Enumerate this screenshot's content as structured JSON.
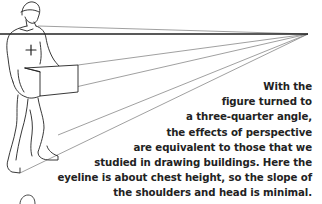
{
  "figure": {
    "vanishing_point": [
      308,
      34
    ],
    "eyeline_y": 34
  },
  "caption": {
    "lines": [
      "With the",
      "figure turned to",
      "a three-quarter angle,",
      "the effects of perspective",
      "are equivalent to those that we",
      "studied in drawing buildings. Here the",
      "eyeline is about chest height, so the slope of",
      "the shoulders and head is minimal."
    ]
  }
}
